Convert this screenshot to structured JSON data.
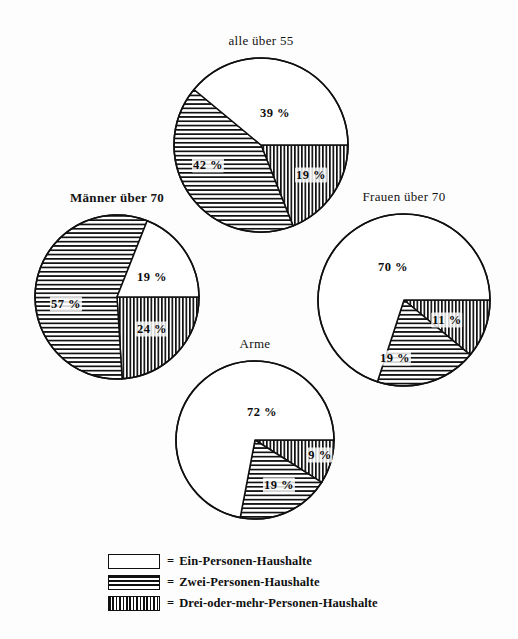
{
  "chart_data": {
    "type": "pie",
    "title": "",
    "legend_position": "bottom",
    "categories": [
      "Ein-Personen-Haushalte",
      "Zwei-Personen-Haushalte",
      "Drei-oder-mehr-Personen-Haushalte"
    ],
    "patterns": [
      "blank",
      "horizontal-lines",
      "vertical-lines"
    ],
    "unit": "%",
    "charts": [
      {
        "title": "alle über 55",
        "title_bold": false,
        "cx": 261,
        "cy": 145,
        "r": 87,
        "slices": [
          {
            "category": "Ein-Personen-Haushalte",
            "value": 39,
            "label": "39 %",
            "pattern": "blank",
            "lx": 275,
            "ly": 113
          },
          {
            "category": "Zwei-Personen-Haushalte",
            "value": 42,
            "label": "42 %",
            "pattern": "horizontal-lines",
            "lx": 208,
            "ly": 165
          },
          {
            "category": "Drei-oder-mehr-Personen-Haushalte",
            "value": 19,
            "label": "19 %",
            "pattern": "vertical-lines",
            "lx": 311,
            "ly": 175
          }
        ]
      },
      {
        "title": "Männer über 70",
        "title_bold": true,
        "cx": 117,
        "cy": 297,
        "r": 82,
        "slices": [
          {
            "category": "Ein-Personen-Haushalte",
            "value": 19,
            "label": "19 %",
            "pattern": "blank",
            "lx": 152,
            "ly": 277
          },
          {
            "category": "Zwei-Personen-Haushalte",
            "value": 57,
            "label": "57 %",
            "pattern": "horizontal-lines",
            "lx": 66,
            "ly": 304
          },
          {
            "category": "Drei-oder-mehr-Personen-Haushalte",
            "value": 24,
            "label": "24 %",
            "pattern": "vertical-lines",
            "lx": 152,
            "ly": 329
          }
        ]
      },
      {
        "title": "Frauen über 70",
        "title_bold": false,
        "cx": 404,
        "cy": 300,
        "r": 86,
        "slices": [
          {
            "category": "Ein-Personen-Haushalte",
            "value": 70,
            "label": "70 %",
            "pattern": "blank",
            "lx": 393,
            "ly": 267
          },
          {
            "category": "Zwei-Personen-Haushalte",
            "value": 19,
            "label": "19 %",
            "pattern": "horizontal-lines",
            "lx": 395,
            "ly": 358
          },
          {
            "category": "Drei-oder-mehr-Personen-Haushalte",
            "value": 11,
            "label": "11 %",
            "pattern": "vertical-lines",
            "lx": 447,
            "ly": 320
          }
        ]
      },
      {
        "title": "Arme",
        "title_bold": false,
        "cx": 255,
        "cy": 440,
        "r": 79,
        "slices": [
          {
            "category": "Ein-Personen-Haushalte",
            "value": 72,
            "label": "72 %",
            "pattern": "blank",
            "lx": 262,
            "ly": 412
          },
          {
            "category": "Zwei-Personen-Haushalte",
            "value": 19,
            "label": "19 %",
            "pattern": "horizontal-lines",
            "lx": 279,
            "ly": 485
          },
          {
            "category": "Drei-oder-mehr-Personen-Haushalte",
            "value": 9,
            "label": "9 %",
            "pattern": "vertical-lines",
            "lx": 320,
            "ly": 455
          }
        ]
      }
    ]
  },
  "titles": {
    "chart0": "alle über 55",
    "chart1": "Männer über 70",
    "chart2": "Frauen über 70",
    "chart3": "Arme"
  },
  "legend": {
    "equals": "=",
    "items": [
      {
        "pattern": "blank",
        "label": "Ein-Personen-Haushalte"
      },
      {
        "pattern": "horizontal-lines",
        "label": "Zwei-Personen-Haushalte"
      },
      {
        "pattern": "vertical-lines",
        "label": "Drei-oder-mehr-Personen-Haushalte"
      }
    ]
  },
  "colors": {
    "ink": "#101010",
    "paper": "#fdfdfd"
  }
}
